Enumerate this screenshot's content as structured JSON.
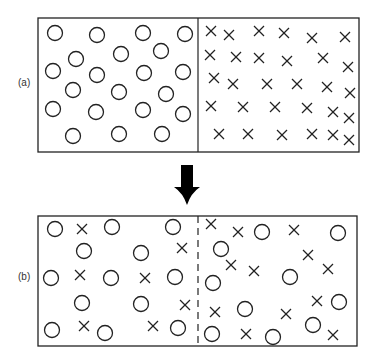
{
  "panels": [
    {
      "id": "a",
      "label": "(a)",
      "box": {
        "x": 38,
        "y": 18,
        "w": 321,
        "h": 134
      },
      "divider": {
        "x": 198,
        "style": "solid"
      },
      "circles": [
        [
          55,
          33
        ],
        [
          97,
          35
        ],
        [
          143,
          33
        ],
        [
          185,
          34
        ],
        [
          76,
          59
        ],
        [
          121,
          54
        ],
        [
          161,
          51
        ],
        [
          53,
          71
        ],
        [
          97,
          75
        ],
        [
          144,
          73
        ],
        [
          183,
          72
        ],
        [
          73,
          90
        ],
        [
          119,
          92
        ],
        [
          166,
          94
        ],
        [
          53,
          109
        ],
        [
          96,
          112
        ],
        [
          143,
          110
        ],
        [
          183,
          114
        ],
        [
          73,
          136
        ],
        [
          119,
          134
        ],
        [
          162,
          134
        ]
      ],
      "crosses": [
        [
          211,
          31
        ],
        [
          229,
          35
        ],
        [
          259,
          31
        ],
        [
          284,
          33
        ],
        [
          312,
          38
        ],
        [
          345,
          37
        ],
        [
          210,
          55
        ],
        [
          236,
          57
        ],
        [
          259,
          58
        ],
        [
          287,
          61
        ],
        [
          323,
          58
        ],
        [
          348,
          67
        ],
        [
          214,
          78
        ],
        [
          233,
          84
        ],
        [
          267,
          84
        ],
        [
          297,
          84
        ],
        [
          327,
          87
        ],
        [
          350,
          93
        ],
        [
          211,
          106
        ],
        [
          243,
          107
        ],
        [
          275,
          107
        ],
        [
          307,
          108
        ],
        [
          333,
          112
        ],
        [
          349,
          118
        ],
        [
          219,
          134
        ],
        [
          248,
          134
        ],
        [
          282,
          135
        ],
        [
          312,
          134
        ],
        [
          333,
          135
        ],
        [
          349,
          140
        ]
      ]
    },
    {
      "id": "b",
      "label": "(b)",
      "box": {
        "x": 38,
        "y": 216,
        "w": 319,
        "h": 130
      },
      "divider": {
        "x": 198,
        "style": "dashed"
      },
      "circles": [
        [
          55,
          229
        ],
        [
          112,
          227
        ],
        [
          173,
          227
        ],
        [
          84,
          251
        ],
        [
          141,
          253
        ],
        [
          51,
          278
        ],
        [
          111,
          278
        ],
        [
          175,
          277
        ],
        [
          82,
          303
        ],
        [
          141,
          304
        ],
        [
          52,
          330
        ],
        [
          105,
          333
        ],
        [
          178,
          328
        ],
        [
          262,
          232
        ],
        [
          338,
          233
        ],
        [
          221,
          249
        ],
        [
          290,
          277
        ],
        [
          213,
          283
        ],
        [
          339,
          302
        ],
        [
          245,
          309
        ],
        [
          212,
          334
        ],
        [
          273,
          337
        ],
        [
          313,
          325
        ]
      ],
      "crosses": [
        [
          82,
          229
        ],
        [
          182,
          248
        ],
        [
          80,
          275
        ],
        [
          145,
          278
        ],
        [
          185,
          305
        ],
        [
          84,
          326
        ],
        [
          153,
          326
        ],
        [
          211,
          224
        ],
        [
          238,
          232
        ],
        [
          294,
          230
        ],
        [
          308,
          255
        ],
        [
          328,
          269
        ],
        [
          231,
          265
        ],
        [
          254,
          271
        ],
        [
          317,
          301
        ],
        [
          215,
          312
        ],
        [
          286,
          314
        ],
        [
          246,
          334
        ],
        [
          333,
          335
        ]
      ]
    }
  ],
  "arrow": {
    "x": 187,
    "top": 165,
    "bottom": 205,
    "direction": "down",
    "color": "#000000"
  },
  "colors": {
    "stroke": "#222222",
    "background": "#ffffff"
  }
}
